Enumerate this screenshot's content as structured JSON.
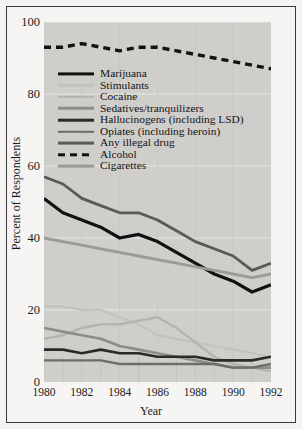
{
  "chart_data": {
    "type": "line",
    "title": "",
    "xlabel": "Year",
    "ylabel": "Percent of Respondents",
    "xlim": [
      1980,
      1992
    ],
    "ylim": [
      0,
      100
    ],
    "xticks": [
      1980,
      1982,
      1984,
      1986,
      1988,
      1990,
      1992
    ],
    "yticks": [
      0,
      20,
      40,
      60,
      80,
      100
    ],
    "grid": "horizontal-and-vertical-light",
    "legend_position": "upper-left-inside",
    "x": [
      1980,
      1981,
      1982,
      1983,
      1984,
      1985,
      1986,
      1987,
      1988,
      1989,
      1990,
      1991,
      1992
    ],
    "series": [
      {
        "name": "Marijuana",
        "color": "#111111",
        "width": 3.2,
        "dash": "none",
        "values": [
          51,
          47,
          45,
          43,
          40,
          41,
          39,
          36,
          33,
          30,
          28,
          25,
          27
        ]
      },
      {
        "name": "Stimulants",
        "color": "#c3c2bf",
        "width": 2.2,
        "dash": "none",
        "values": [
          21,
          21,
          20,
          20,
          18,
          16,
          13,
          12,
          11,
          10,
          9,
          8,
          7
        ]
      },
      {
        "name": "Cocaine",
        "color": "#b4b3b0",
        "width": 2.4,
        "dash": "none",
        "values": [
          12,
          13,
          15,
          16,
          16,
          17,
          18,
          15,
          11,
          7,
          5,
          4,
          3
        ]
      },
      {
        "name": "Sedatives/tranquilizers",
        "color": "#8d8c89",
        "width": 2.6,
        "dash": "none",
        "values": [
          15,
          14,
          13,
          12,
          10,
          9,
          8,
          7,
          6,
          5,
          4,
          4,
          4
        ]
      },
      {
        "name": "Hallucinogens (including LSD)",
        "color": "#2a2a2a",
        "width": 2.6,
        "dash": "none",
        "values": [
          9,
          9,
          8,
          9,
          8,
          8,
          7,
          7,
          7,
          6,
          6,
          6,
          7
        ]
      },
      {
        "name": "Opiates (including heroin)",
        "color": "#6e6d6a",
        "width": 2.4,
        "dash": "none",
        "values": [
          6,
          6,
          6,
          6,
          5,
          5,
          5,
          5,
          5,
          5,
          4,
          4,
          5
        ]
      },
      {
        "name": "Any illegal drug",
        "color": "#5a5956",
        "width": 2.8,
        "dash": "none",
        "values": [
          57,
          55,
          51,
          49,
          47,
          47,
          45,
          42,
          39,
          37,
          35,
          31,
          33
        ]
      },
      {
        "name": "Alcohol",
        "color": "#121212",
        "width": 3.4,
        "dash": "7,5",
        "values": [
          93,
          93,
          94,
          93,
          92,
          93,
          93,
          92,
          91,
          90,
          89,
          88,
          87
        ]
      },
      {
        "name": "Cigarettes",
        "color": "#9b9a97",
        "width": 2.8,
        "dash": "none",
        "values": [
          40,
          39,
          38,
          37,
          36,
          35,
          34,
          33,
          32,
          31,
          30,
          29,
          30
        ]
      }
    ]
  },
  "axes": {
    "y_title": "Percent of Respondents",
    "x_title": "Year",
    "y_tick_labels": [
      "0",
      "20",
      "40",
      "60",
      "80",
      "100"
    ],
    "x_tick_labels": [
      "1980",
      "1982",
      "1984",
      "1986",
      "1988",
      "1990",
      "1992"
    ]
  },
  "legend": {
    "items": [
      {
        "label": "Marijuana"
      },
      {
        "label": "Stimulants"
      },
      {
        "label": "Cocaine"
      },
      {
        "label": "Sedatives/tranquilizers"
      },
      {
        "label": "Hallucinogens (including LSD)"
      },
      {
        "label": "Opiates (including heroin)"
      },
      {
        "label": "Any illegal drug"
      },
      {
        "label": "Alcohol"
      },
      {
        "label": "Cigarettes"
      }
    ]
  },
  "colors": {
    "plot_background": "#cfcecb",
    "page_background": "#f4f3f1",
    "border": "#3a3a3a",
    "gridline": "#e6e5e2",
    "text": "#1b1b1b"
  }
}
